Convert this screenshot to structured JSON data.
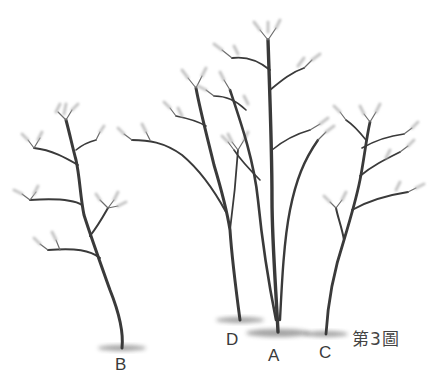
{
  "figure": {
    "caption": "第3圖",
    "caption_parts": [
      "第",
      "3",
      "圖"
    ]
  },
  "trees": [
    {
      "id": "B",
      "label": "B"
    },
    {
      "id": "D",
      "label": "D"
    },
    {
      "id": "A",
      "label": "A"
    },
    {
      "id": "C",
      "label": "C"
    }
  ],
  "colors": {
    "background": "#ffffff",
    "ink": "#3a3a3a",
    "foliage": "#b8b8b8"
  }
}
